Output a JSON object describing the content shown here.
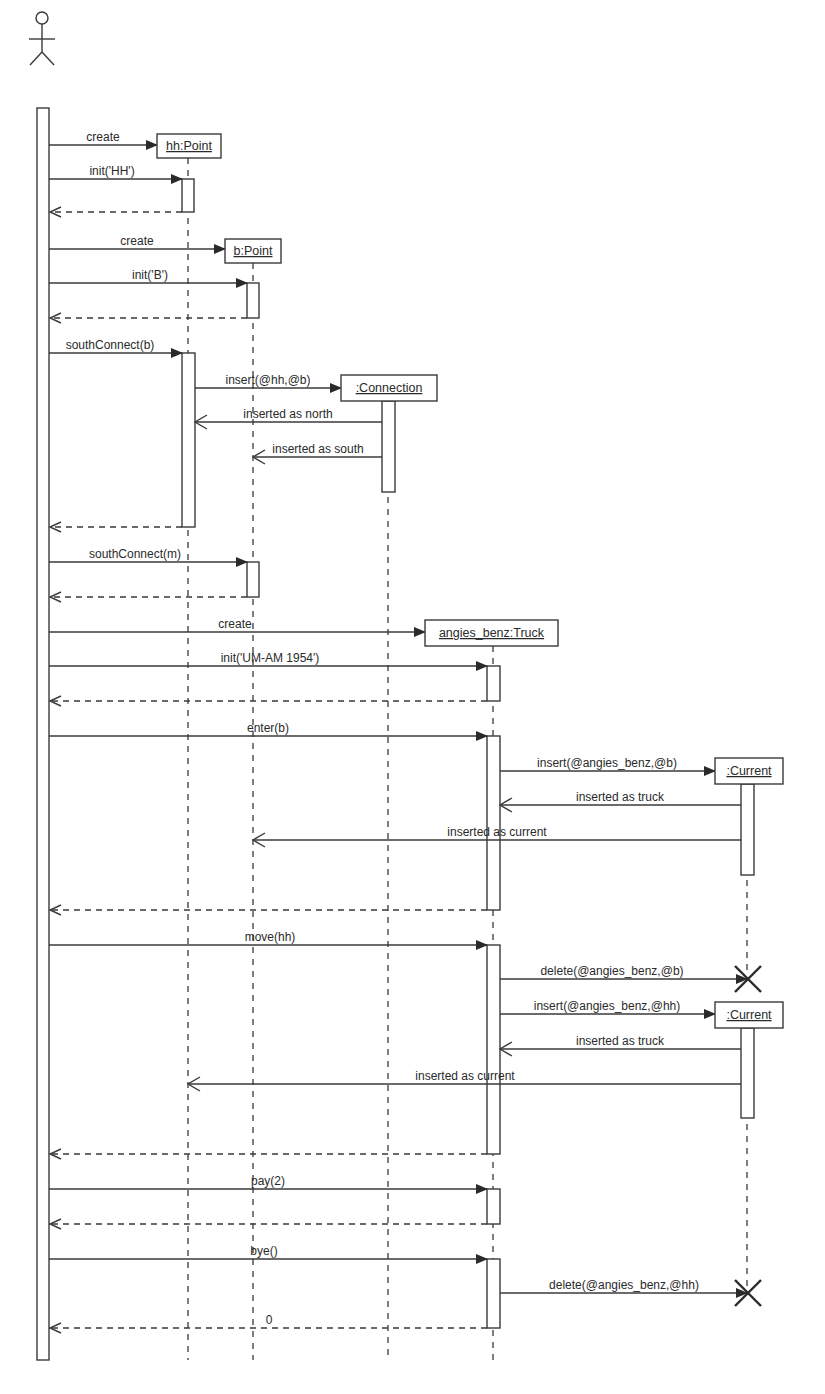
{
  "diagram": {
    "type": "UML sequence diagram",
    "colors": {
      "ink": "#3a3a3a",
      "background": "#ffffff"
    },
    "actor": {
      "name": "actor",
      "x": 42
    },
    "objects": [
      {
        "id": "hh",
        "label": "hh:Point",
        "x": 188,
        "box": [
          157,
          134,
          64,
          24
        ],
        "lifeline_end": 1360
      },
      {
        "id": "b",
        "label": "b:Point",
        "x": 253,
        "box": [
          225,
          239,
          56,
          24
        ],
        "lifeline_end": 1360
      },
      {
        "id": "conn",
        "label": ":Connection",
        "x": 388,
        "box": [
          341,
          375,
          96,
          26
        ],
        "lifeline_end": 1360
      },
      {
        "id": "truck",
        "label": "angies_benz:Truck",
        "x": 493,
        "box": [
          425,
          620,
          133,
          26
        ],
        "lifeline_end": 1360
      },
      {
        "id": "cur1",
        "label": ":Current",
        "x": 747,
        "box": [
          715,
          758,
          68,
          26
        ],
        "lifeline_end": 970
      },
      {
        "id": "cur2",
        "label": ":Current",
        "x": 747,
        "box": [
          715,
          1002,
          68,
          26
        ],
        "lifeline_end": 1290
      }
    ],
    "messages": [
      {
        "label": "create",
        "kind": "create",
        "from": 49,
        "to": 157,
        "y": 145,
        "label_x": 103
      },
      {
        "label": "init('HH')",
        "kind": "call",
        "from": 49,
        "to": 182,
        "y": 179,
        "label_x": 112
      },
      {
        "label": "",
        "kind": "return",
        "from": 182,
        "to": 49,
        "y": 212
      },
      {
        "label": "create",
        "kind": "create",
        "from": 49,
        "to": 225,
        "y": 249,
        "label_x": 137
      },
      {
        "label": "init('B')",
        "kind": "call",
        "from": 49,
        "to": 247,
        "y": 283,
        "label_x": 150
      },
      {
        "label": "",
        "kind": "return",
        "from": 247,
        "to": 49,
        "y": 318
      },
      {
        "label": "southConnect(b)",
        "kind": "call",
        "from": 49,
        "to": 182,
        "y": 353,
        "label_x": 110
      },
      {
        "label": "insert(@hh,@b)",
        "kind": "create",
        "from": 195,
        "to": 341,
        "y": 388,
        "label_x": 268
      },
      {
        "label": "inserted as north",
        "kind": "reply",
        "from": 382,
        "to": 195,
        "y": 422,
        "label_x": 288
      },
      {
        "label": "inserted as south",
        "kind": "reply",
        "from": 382,
        "to": 253,
        "y": 457,
        "label_x": 318
      },
      {
        "label": "",
        "kind": "return",
        "from": 182,
        "to": 49,
        "y": 527
      },
      {
        "label": "southConnect(m)",
        "kind": "call",
        "from": 49,
        "to": 247,
        "y": 562,
        "label_x": 135
      },
      {
        "label": "",
        "kind": "return",
        "from": 247,
        "to": 49,
        "y": 597
      },
      {
        "label": "create",
        "kind": "create",
        "from": 49,
        "to": 425,
        "y": 632,
        "label_x": 235
      },
      {
        "label": "init('UM-AM 1954')",
        "kind": "call",
        "from": 49,
        "to": 487,
        "y": 666,
        "label_x": 270
      },
      {
        "label": "",
        "kind": "return",
        "from": 487,
        "to": 49,
        "y": 701
      },
      {
        "label": "enter(b)",
        "kind": "call",
        "from": 49,
        "to": 487,
        "y": 736,
        "label_x": 268
      },
      {
        "label": "insert(@angies_benz,@b)",
        "kind": "create",
        "from": 500,
        "to": 715,
        "y": 771,
        "label_x": 607
      },
      {
        "label": "inserted as truck",
        "kind": "reply",
        "from": 741,
        "to": 500,
        "y": 805,
        "label_x": 620
      },
      {
        "label": "inserted as current",
        "kind": "reply",
        "from": 741,
        "to": 253,
        "y": 840,
        "label_x": 497
      },
      {
        "label": "",
        "kind": "return",
        "from": 487,
        "to": 49,
        "y": 910
      },
      {
        "label": "move(hh)",
        "kind": "call",
        "from": 49,
        "to": 487,
        "y": 945,
        "label_x": 270
      },
      {
        "label": "delete(@angies_benz,@b)",
        "kind": "call",
        "from": 500,
        "to": 747,
        "y": 979,
        "label_x": 612
      },
      {
        "label": "insert(@angies_benz,@hh)",
        "kind": "create",
        "from": 500,
        "to": 715,
        "y": 1014,
        "label_x": 607
      },
      {
        "label": "inserted as truck",
        "kind": "reply",
        "from": 741,
        "to": 500,
        "y": 1049,
        "label_x": 620
      },
      {
        "label": "inserted as current",
        "kind": "reply",
        "from": 741,
        "to": 188,
        "y": 1084,
        "label_x": 465
      },
      {
        "label": "",
        "kind": "return",
        "from": 487,
        "to": 49,
        "y": 1154
      },
      {
        "label": "pay(2)",
        "kind": "call",
        "from": 49,
        "to": 487,
        "y": 1189,
        "label_x": 268
      },
      {
        "label": "",
        "kind": "return",
        "from": 487,
        "to": 49,
        "y": 1224
      },
      {
        "label": "bye()",
        "kind": "call",
        "from": 49,
        "to": 487,
        "y": 1259,
        "label_x": 264
      },
      {
        "label": "delete(@angies_benz,@hh)",
        "kind": "call",
        "from": 500,
        "to": 747,
        "y": 1293,
        "label_x": 624
      },
      {
        "label": "0",
        "kind": "return",
        "from": 487,
        "to": 49,
        "y": 1328,
        "label_x": 269
      }
    ],
    "activations": [
      {
        "on": "actor",
        "x": 37,
        "y1": 108,
        "y2": 1360,
        "w": 12
      },
      {
        "on": "hh",
        "x": 182,
        "y1": 179,
        "y2": 212,
        "w": 12
      },
      {
        "on": "b",
        "x": 247,
        "y1": 283,
        "y2": 318,
        "w": 12
      },
      {
        "on": "hh",
        "x": 182,
        "y1": 353,
        "y2": 527,
        "w": 13
      },
      {
        "on": "conn",
        "x": 382,
        "y1": 401,
        "y2": 492,
        "w": 13
      },
      {
        "on": "b",
        "x": 247,
        "y1": 562,
        "y2": 597,
        "w": 12
      },
      {
        "on": "truck",
        "x": 487,
        "y1": 666,
        "y2": 701,
        "w": 13
      },
      {
        "on": "truck",
        "x": 487,
        "y1": 736,
        "y2": 910,
        "w": 13
      },
      {
        "on": "cur1",
        "x": 741,
        "y1": 784,
        "y2": 875,
        "w": 13
      },
      {
        "on": "truck",
        "x": 487,
        "y1": 945,
        "y2": 1154,
        "w": 13
      },
      {
        "on": "cur2",
        "x": 741,
        "y1": 1028,
        "y2": 1118,
        "w": 13
      },
      {
        "on": "truck",
        "x": 487,
        "y1": 1189,
        "y2": 1224,
        "w": 13
      },
      {
        "on": "truck",
        "x": 487,
        "y1": 1259,
        "y2": 1328,
        "w": 13
      }
    ],
    "destructions": [
      {
        "object": ":Current",
        "x": 748,
        "y": 979
      },
      {
        "object": ":Current",
        "x": 748,
        "y": 1293
      }
    ]
  }
}
